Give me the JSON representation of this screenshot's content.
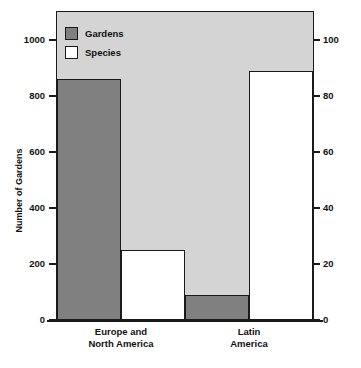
{
  "chart_data": {
    "type": "bar",
    "title": "",
    "subtitle": "",
    "xlabel": "",
    "categories": [
      "Europe and North America",
      "Latin America"
    ],
    "category_lines": [
      [
        "Europe and",
        "North America"
      ],
      [
        "Latin",
        "America"
      ]
    ],
    "series": [
      {
        "name": "Gardens",
        "axis": "left",
        "color": "#808080",
        "values": [
          860,
          90
        ],
        "unit": "gardens"
      },
      {
        "name": "Species",
        "axis": "right",
        "color": "#ffffff",
        "values": [
          25,
          89
        ],
        "unit": "thousands of species"
      }
    ],
    "axes": {
      "left": {
        "label": "Number of Gardens",
        "ticks": [
          0,
          200,
          400,
          600,
          800,
          1000
        ],
        "tick_labels": [
          "0",
          "200",
          "400",
          "600",
          "800",
          "1000"
        ],
        "lim": [
          0,
          1100
        ]
      },
      "right": {
        "label": "Number of Species (in Thousands)",
        "ticks": [
          0,
          20,
          40,
          60,
          80,
          100
        ],
        "tick_labels": [
          "0",
          "20",
          "40",
          "60",
          "80",
          "100"
        ],
        "lim": [
          0,
          110
        ]
      }
    },
    "legend": {
      "position": "top-left-inside",
      "entries": [
        {
          "label": "Gardens",
          "swatch": "dark-gray-filled"
        },
        {
          "label": "Species",
          "swatch": "white-filled"
        }
      ]
    },
    "grid": false,
    "plot_background": "#d4d4d4"
  }
}
